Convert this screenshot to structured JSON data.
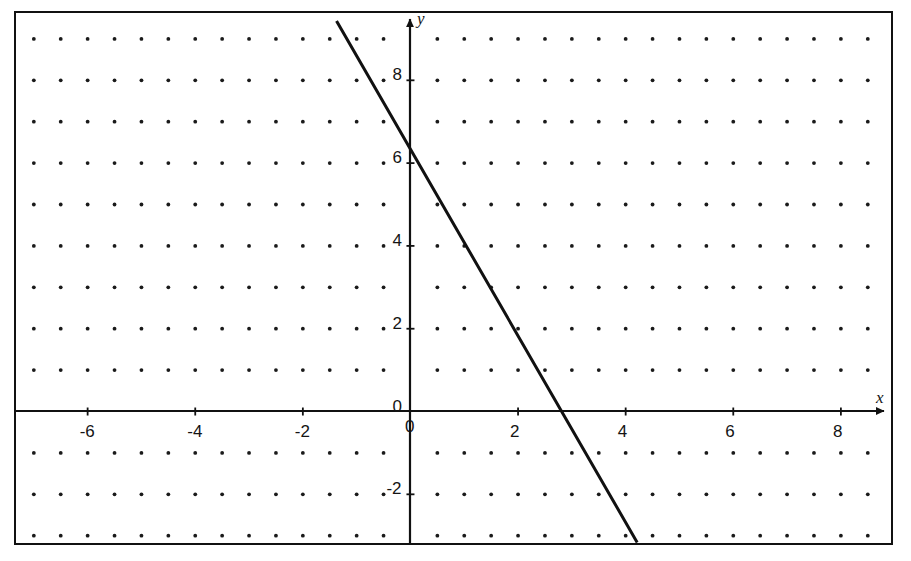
{
  "figure": {
    "kind": "cartesian-coordinate-plane",
    "width": 911,
    "height": 561,
    "background_color": "#ffffff",
    "ink_color": "#111111",
    "border_color": "#111111"
  },
  "axes": {
    "x_axis_label": "x",
    "y_axis_label": "y",
    "origin_label": "0",
    "x_tick_labels": [
      "-6",
      "-4",
      "-2",
      "0",
      "2",
      "4",
      "6",
      "8"
    ],
    "y_tick_labels": [
      "8",
      "6",
      "4",
      "2",
      "0",
      "-2"
    ],
    "x_arrow": "right-arrow-icon",
    "y_arrow": "up-arrow-icon"
  },
  "chart_data": {
    "type": "line",
    "title": "",
    "xlabel": "x",
    "ylabel": "y",
    "grid": "dot-lattice",
    "grid_dot_spacing_x": 0.5,
    "grid_dot_spacing_y": 1,
    "legend": "none",
    "xlim": [
      -7.35,
      8.95
    ],
    "ylim": [
      -3.2,
      9.65
    ],
    "x_ticks": [
      -6,
      -4,
      -2,
      0,
      2,
      4,
      6,
      8
    ],
    "y_ticks": [
      8,
      6,
      4,
      2,
      0,
      -2
    ],
    "series": [
      {
        "name": "line",
        "slope": -2.2,
        "y_intercept": 6.4,
        "x_intercept": 2.93,
        "x": [
          -1.36,
          4.2
        ],
        "y": [
          9.4,
          -3.13
        ],
        "points": [
          {
            "x": -1.36,
            "y": 9.4
          },
          {
            "x": 0,
            "y": 6.4
          },
          {
            "x": 2.93,
            "y": 0
          },
          {
            "x": 4.2,
            "y": -3.13
          }
        ]
      }
    ]
  }
}
